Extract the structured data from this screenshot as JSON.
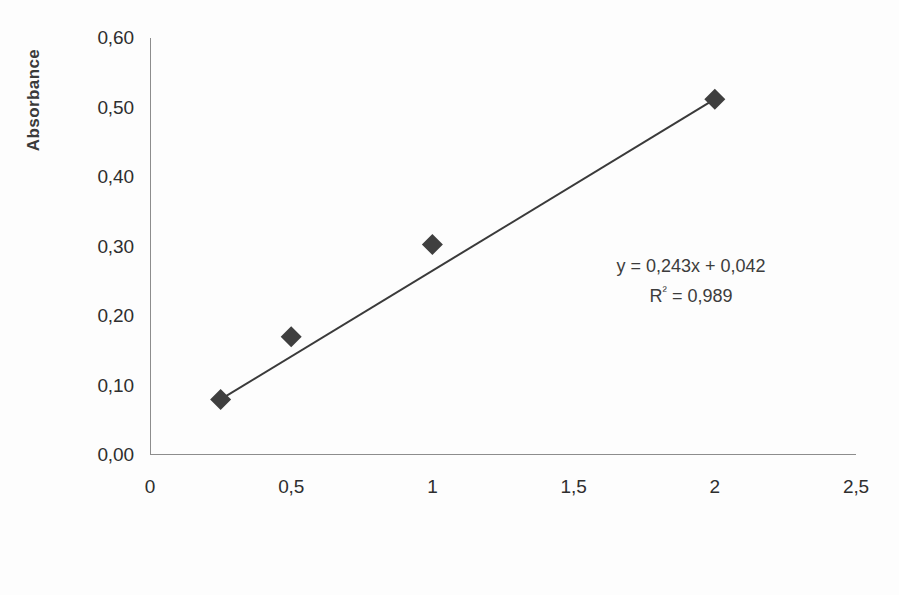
{
  "chart_data": {
    "type": "scatter",
    "title": "",
    "xlabel": "Concentration [%]",
    "ylabel": "Absorbance",
    "xlim": [
      0,
      2.5
    ],
    "ylim": [
      0,
      0.6
    ],
    "grid": false,
    "legend": "none",
    "x_tick_labels": [
      "0",
      "0,5",
      "1",
      "1,5",
      "2",
      "2,5"
    ],
    "x_tick_values": [
      0,
      0.5,
      1,
      1.5,
      2,
      2.5
    ],
    "y_tick_labels": [
      "0,00",
      "0,10",
      "0,20",
      "0,30",
      "0,40",
      "0,50",
      "0,60"
    ],
    "y_tick_values": [
      0,
      0.1,
      0.2,
      0.3,
      0.4,
      0.5,
      0.6
    ],
    "series": [
      {
        "name": "Calibration points",
        "marker": "diamond",
        "marker_color": "#3f3f3f",
        "x": [
          0.25,
          0.5,
          1.0,
          2.0
        ],
        "y": [
          0.08,
          0.17,
          0.303,
          0.512
        ]
      }
    ],
    "trendline": {
      "type": "linear",
      "slope": 0.243,
      "intercept": 0.042,
      "r_squared": 0.989,
      "color": "#3a3a3a",
      "x_start": 0.25,
      "x_end": 2.0,
      "y_start": 0.08,
      "y_end": 0.512
    },
    "annotations": {
      "equation": "y = 0,243x + 0,042",
      "r_squared_prefix": "R",
      "r_squared_sup": "²",
      "r_squared_value": " = 0,989"
    }
  }
}
